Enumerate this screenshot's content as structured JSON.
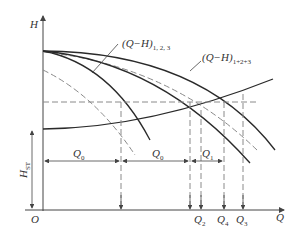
{
  "diagram": {
    "axes": {
      "y_label": "H",
      "x_label": "Q",
      "origin_label": "O"
    },
    "curve_labels": {
      "individual": {
        "main": "(Q−H)",
        "sub": "1, 2, 3"
      },
      "combined": {
        "main": "(Q−H)",
        "sub": "1+2+3"
      }
    },
    "static_head": {
      "main": "H",
      "sub": "ST"
    },
    "flow_dimensions": [
      {
        "main": "Q",
        "sub": "0"
      },
      {
        "main": "Q",
        "sub": "0"
      },
      {
        "main": "Q",
        "sub": "1"
      }
    ],
    "x_ticks": [
      {
        "main": "Q",
        "sub": "2"
      },
      {
        "main": "Q",
        "sub": "4"
      },
      {
        "main": "Q",
        "sub": "3"
      }
    ],
    "colors": {
      "solid_curve": "#2a2a2a",
      "dashed_curve": "#8a8a8a",
      "background": "#ffffff"
    }
  }
}
